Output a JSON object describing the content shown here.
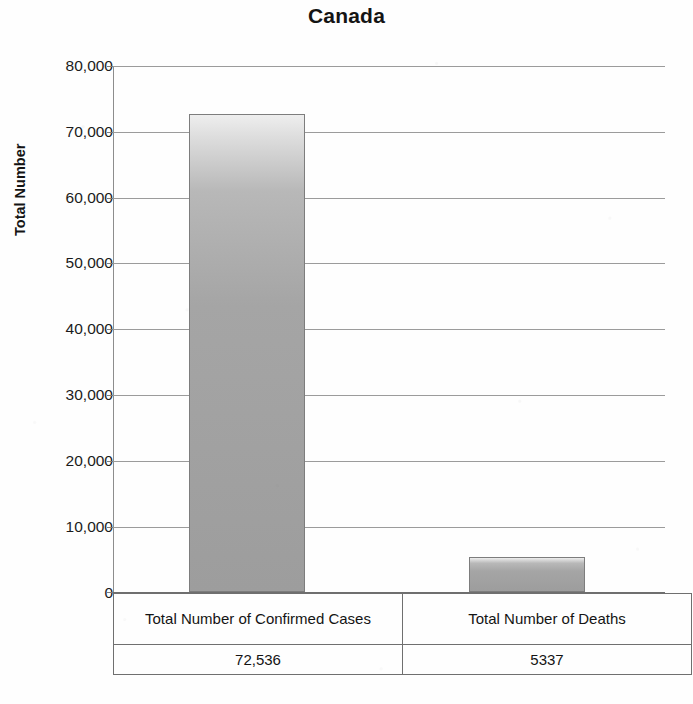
{
  "chart_data": {
    "type": "bar",
    "title": "Canada",
    "xlabel": "",
    "ylabel": "Total Number",
    "ylim": [
      0,
      80000
    ],
    "grid": true,
    "legend": "none",
    "categories": [
      "Total Number of Confirmed Cases",
      "Total Number of Deaths"
    ],
    "values": [
      72536,
      5337
    ],
    "value_labels": [
      "72,536",
      "5337"
    ],
    "ytick_labels": [
      "80,000",
      "70,000",
      "60,000",
      "50,000",
      "40,000",
      "30,000",
      "20,000",
      "10,000",
      "0"
    ],
    "ytick_values": [
      80000,
      70000,
      60000,
      50000,
      40000,
      30000,
      20000,
      10000,
      0
    ],
    "series": [
      {
        "name": "Total Number",
        "values": [
          72536,
          5337
        ]
      }
    ],
    "data_table": {
      "columns": [
        "Total Number of Confirmed Cases",
        "Total Number of Deaths"
      ],
      "row": [
        "72,536",
        "5337"
      ]
    },
    "colors": {
      "bar_fill_top": "#eeeeee",
      "bar_fill_bottom": "#9d9d9d",
      "bar_border": "#7d7d7d",
      "gridline": "#9b9b9b",
      "axis": "#6e6e6e",
      "text": "#141414",
      "background": "#fefefe"
    }
  }
}
